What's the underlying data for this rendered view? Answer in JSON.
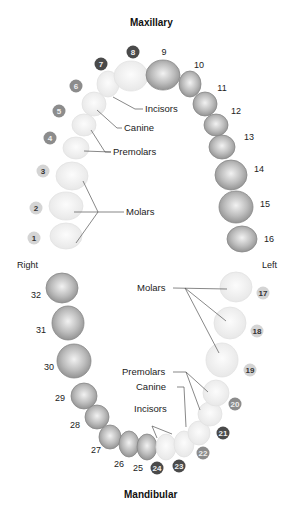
{
  "titles": {
    "top": "Maxillary",
    "bottom": "Mandibular",
    "right": "Right",
    "left": "Left"
  },
  "upper_labels": {
    "incisors": "Incisors",
    "canine": "Canine",
    "premolars": "Premolars",
    "molars": "Molars"
  },
  "lower_labels": {
    "molars": "Molars",
    "premolars": "Premolars",
    "canine": "Canine",
    "incisors": "Incisors"
  },
  "teeth": {
    "t1": "1",
    "t2": "2",
    "t3": "3",
    "t4": "4",
    "t5": "5",
    "t6": "6",
    "t7": "7",
    "t8": "8",
    "t9": "9",
    "t10": "10",
    "t11": "11",
    "t12": "12",
    "t13": "13",
    "t14": "14",
    "t15": "15",
    "t16": "16",
    "t17": "17",
    "t18": "18",
    "t19": "19",
    "t20": "20",
    "t21": "21",
    "t22": "22",
    "t23": "23",
    "t24": "24",
    "t25": "25",
    "t26": "26",
    "t27": "27",
    "t28": "28",
    "t29": "29",
    "t30": "30",
    "t31": "31",
    "t32": "32"
  },
  "colors": {
    "badge_light": "#d4d4d4",
    "badge_mid": "#8c8c8c",
    "badge_dark": "#4a4a4a",
    "tooth_shaded": "#a8a8a8",
    "tooth_faded": "#ececec"
  }
}
